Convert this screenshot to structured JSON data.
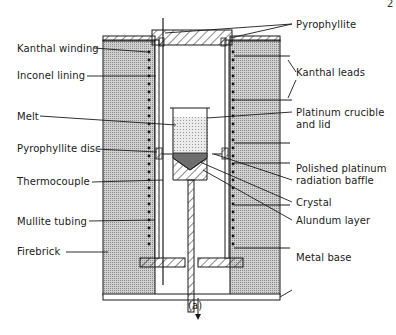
{
  "page_number": "2",
  "caption": "(a)",
  "labels_left": {
    "kanthal_winding": "Kanthal winding",
    "inconel_lining": "Inconel lining",
    "melt": "Melt",
    "pyrophyllite_disc": "Pyrophyllite disc",
    "thermocouple": "Thermocouple",
    "mullite_tubing": "Mullite tubing",
    "firebrick": "Firebrick"
  },
  "labels_right": {
    "pyrophyllite": "Pyrophyllite",
    "kanthal_leads": "Kanthal leads",
    "platinum_crucible_1": "Platinum crucible",
    "platinum_crucible_2": "and lid",
    "polished_baffle_1": "Polished platinum",
    "polished_baffle_2": "radiation baffle",
    "crystal": "Crystal",
    "alundum_layer": "Alundum layer",
    "metal_base": "Metal base"
  },
  "colors": {
    "ink": "#1a1a1a",
    "firebrick_fill": "#bdbdbd",
    "melt_fill": "#d8d8d8",
    "crystal_fill": "#6e6e6e"
  }
}
